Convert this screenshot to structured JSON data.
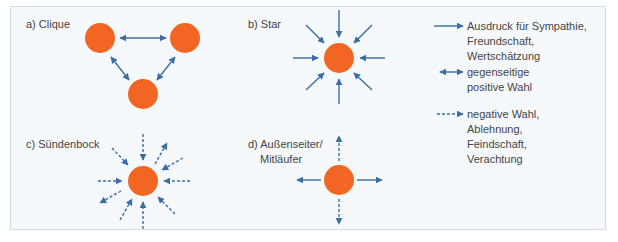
{
  "colors": {
    "node": "#F26522",
    "arrow": "#3A6EA5",
    "background": "#F6F9FB",
    "border": "#D5DEE6"
  },
  "panels": {
    "a": {
      "label": "a) Clique",
      "nodes": 3,
      "arrows": [
        "bidirectional",
        "bidirectional",
        "bidirectional"
      ]
    },
    "b": {
      "label": "b) Star",
      "nodes": 1,
      "arrows": "8 solid arrows pointing inward"
    },
    "c": {
      "label": "c) Sündenbock",
      "nodes": 1,
      "arrows": "10 dashed arrows, 8 pointing inward, 2 pointing outward"
    },
    "d": {
      "label_line1": "d) Außenseiter/",
      "label_line2": "Mitläufer",
      "nodes": 1,
      "arrows": "2 solid horizontal outward, 2 dashed vertical outward"
    }
  },
  "legend": {
    "items": [
      {
        "icon": "solid-arrow-icon",
        "lines": [
          "Ausdruck für Sympathie,",
          "Freundschaft,",
          "Wertschätzung"
        ]
      },
      {
        "icon": "bidirectional-arrow-icon",
        "lines": [
          "gegenseitige",
          "positive Wahl"
        ]
      },
      {
        "icon": "dashed-arrow-icon",
        "lines": [
          "negative Wahl,",
          "Ablehnung,",
          "Feindschaft,",
          "Verachtung"
        ]
      }
    ]
  }
}
